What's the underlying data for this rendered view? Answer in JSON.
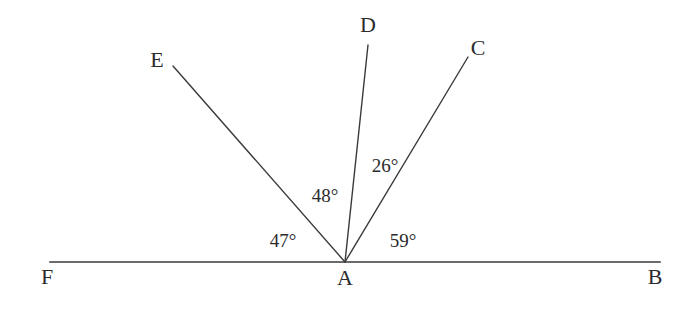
{
  "figure": {
    "type": "angle-diagram",
    "background_color": "#ffffff",
    "stroke_color": "#3a3a3a",
    "text_color": "#2b2b2b",
    "width": 681,
    "height": 312,
    "vertex": {
      "name": "A",
      "x": 345,
      "y": 262
    },
    "baseline": {
      "name": "line-FB",
      "x1": 50,
      "y1": 262,
      "x2": 660,
      "y2": 262,
      "stroke_width": 1.6
    },
    "rays": [
      {
        "name": "ray-AE",
        "to_point": "E",
        "x1": 345,
        "y1": 262,
        "x2": 173,
        "y2": 66,
        "stroke_width": 1.4
      },
      {
        "name": "ray-AD",
        "to_point": "D",
        "x1": 345,
        "y1": 262,
        "x2": 368,
        "y2": 45,
        "stroke_width": 1.4
      },
      {
        "name": "ray-AC",
        "to_point": "C",
        "x1": 345,
        "y1": 262,
        "x2": 468,
        "y2": 57,
        "stroke_width": 1.4
      }
    ],
    "point_labels": [
      {
        "name": "point-label-E",
        "text": "E",
        "x": 157,
        "y": 60
      },
      {
        "name": "point-label-D",
        "text": "D",
        "x": 368,
        "y": 25
      },
      {
        "name": "point-label-C",
        "text": "C",
        "x": 478,
        "y": 48
      },
      {
        "name": "point-label-F",
        "text": "F",
        "x": 47,
        "y": 277
      },
      {
        "name": "point-label-A",
        "text": "A",
        "x": 345,
        "y": 278
      },
      {
        "name": "point-label-B",
        "text": "B",
        "x": 655,
        "y": 277
      }
    ],
    "angle_labels": [
      {
        "name": "angle-label-FAE",
        "text": "47°",
        "value": 47,
        "unit": "degrees",
        "between": [
          "AF",
          "AE"
        ],
        "x": 283,
        "y": 240
      },
      {
        "name": "angle-label-EAD",
        "text": "48°",
        "value": 48,
        "unit": "degrees",
        "between": [
          "AE",
          "AD"
        ],
        "x": 325,
        "y": 195
      },
      {
        "name": "angle-label-DAC",
        "text": "26°",
        "value": 26,
        "unit": "degrees",
        "between": [
          "AD",
          "AC"
        ],
        "x": 385,
        "y": 165
      },
      {
        "name": "angle-label-CAB",
        "text": "59°",
        "value": 59,
        "unit": "degrees",
        "between": [
          "AC",
          "AB"
        ],
        "x": 403,
        "y": 240
      }
    ]
  }
}
